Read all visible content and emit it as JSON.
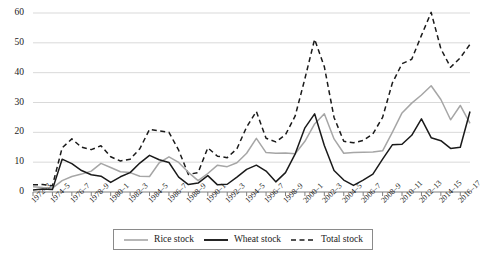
{
  "chart_data": {
    "type": "line",
    "title": "",
    "xlabel": "",
    "ylabel": "",
    "ylim": [
      0,
      60
    ],
    "yticks": [
      0,
      10,
      20,
      30,
      40,
      50,
      60
    ],
    "grid": true,
    "legend_position": "bottom",
    "x": [
      "1972–3",
      "1973–4",
      "1974–5",
      "1975–6",
      "1976–7",
      "1977–8",
      "1978–9",
      "1979–80",
      "1980–1",
      "1981–2",
      "1982–3",
      "1983–4",
      "1984–5",
      "1985–6",
      "1986–7",
      "1987–8",
      "1988–9",
      "1989–90",
      "1990–1",
      "1991–2",
      "1992–3",
      "1993–4",
      "1994–5",
      "1995–6",
      "1996–7",
      "1997–8",
      "1998–9",
      "1999–2000",
      "2000–1",
      "2001–2",
      "2002–3",
      "2003–4",
      "2004–5",
      "2005–6",
      "2006–7",
      "2007–8",
      "2008–9",
      "2009–10",
      "2010–11",
      "2011–12",
      "2012–13",
      "2013–14",
      "2014–15",
      "2015–16",
      "2016–17",
      "2017–18"
    ],
    "xtick_labels": [
      "1972–3",
      "1974–5",
      "1976–7",
      "1978–9",
      "1980–1",
      "1982–3",
      "1984–5",
      "1986–7",
      "1988–9",
      "1990–1",
      "1992–3",
      "1994–5",
      "1996–7",
      "1998–9",
      "2000–1",
      "2002–3",
      "2004–5",
      "2006–7",
      "2008–9",
      "2010–11",
      "2012–13",
      "2014–15",
      "2016–17"
    ],
    "xtick_indices": [
      0,
      2,
      4,
      6,
      8,
      10,
      12,
      14,
      16,
      18,
      20,
      22,
      24,
      26,
      28,
      30,
      32,
      34,
      36,
      38,
      40,
      42,
      44
    ],
    "series": [
      {
        "name": "Rice stock",
        "color": "#a6a6a6",
        "style": "solid",
        "values": [
          1.8,
          1.5,
          1.3,
          3.8,
          5.2,
          6.0,
          7.0,
          9.6,
          8.2,
          6.8,
          6.5,
          5.3,
          5.2,
          9.8,
          11.8,
          9.9,
          6.6,
          3.8,
          6.2,
          9.0,
          8.5,
          9.8,
          13.0,
          18.0,
          13.2,
          13.0,
          13.1,
          12.8,
          17.0,
          22.8,
          26.2,
          17.8,
          13.0,
          13.2,
          13.3,
          13.4,
          13.8,
          20.0,
          26.5,
          29.8,
          32.5,
          35.6,
          31.0,
          24.2,
          29.0,
          23.0
        ]
      },
      {
        "name": "Wheat stock",
        "color": "#1a1a1a",
        "style": "solid",
        "values": [
          0.7,
          1.0,
          0.8,
          11.0,
          9.5,
          7.2,
          5.8,
          5.3,
          3.2,
          5.1,
          6.5,
          9.7,
          12.3,
          10.8,
          9.9,
          5.0,
          2.5,
          3.0,
          5.5,
          2.4,
          2.6,
          5.0,
          7.6,
          9.0,
          7.0,
          3.4,
          6.5,
          12.8,
          21.5,
          26.2,
          15.6,
          7.2,
          4.0,
          2.2,
          4.0,
          6.0,
          11.0,
          15.8,
          16.0,
          19.0,
          24.5,
          18.2,
          17.2,
          14.6,
          15.0,
          27.0
        ]
      },
      {
        "name": "Total stock",
        "color": "#1a1a1a",
        "style": "dashed",
        "values": [
          2.4,
          2.5,
          2.1,
          14.8,
          17.8,
          15.0,
          14.2,
          15.5,
          11.8,
          10.4,
          11.0,
          14.5,
          21.0,
          20.5,
          20.0,
          14.0,
          5.9,
          6.5,
          14.8,
          12.0,
          11.5,
          14.5,
          21.8,
          27.0,
          18.0,
          16.8,
          19.2,
          25.5,
          38.0,
          51.2,
          42.0,
          25.0,
          17.0,
          16.5,
          17.3,
          19.5,
          25.0,
          36.5,
          43.0,
          44.5,
          52.5,
          60.2,
          48.0,
          41.8,
          45.0,
          49.5
        ]
      }
    ]
  },
  "legend": {
    "items": [
      {
        "label": "Rice stock",
        "icon": "line-solid-gray-icon"
      },
      {
        "label": "Wheat stock",
        "icon": "line-solid-black-icon"
      },
      {
        "label": "Total stock",
        "icon": "line-dashed-black-icon"
      }
    ]
  },
  "colors": {
    "rice": "#a6a6a6",
    "wheat": "#1a1a1a",
    "total": "#1a1a1a",
    "grid": "#d9d9d9",
    "axis": "#7f7f7f",
    "text": "#1a1a1a"
  }
}
